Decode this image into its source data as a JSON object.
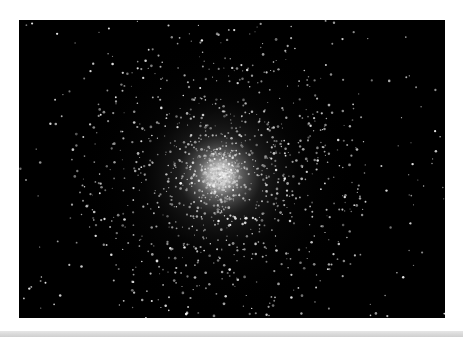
{
  "image": {
    "subject": "Globular star cluster on black sky",
    "background_color": "#000000",
    "border_color": "#ffffff",
    "cluster_center": {
      "x": 201,
      "y": 155
    },
    "bar_color": "#d6d6d6"
  }
}
